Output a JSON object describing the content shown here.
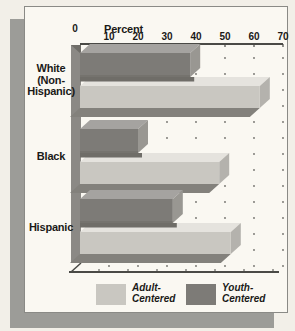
{
  "chart_data": {
    "type": "bar",
    "orientation": "horizontal",
    "xlabel": "Percent",
    "categories": [
      "White (Non-Hispanic)",
      "Black",
      "Hispanic"
    ],
    "category_label_lines": [
      [
        "White",
        "(Non-",
        "Hispanic)"
      ],
      [
        "Black"
      ],
      [
        "Hispanic"
      ]
    ],
    "series": [
      {
        "name": "Adult-Centered",
        "values": [
          62,
          48,
          52
        ]
      },
      {
        "name": "Youth-Centered",
        "values": [
          38,
          20,
          32
        ]
      }
    ],
    "xlim": [
      0,
      70
    ],
    "tick_step": 10,
    "tick_labels": [
      "0",
      "10",
      "20",
      "30",
      "40",
      "50",
      "60",
      "70"
    ],
    "grid": "dotted-vertical",
    "legend_position": "bottom",
    "style": "3d-extruded-bars"
  },
  "legend": {
    "items": [
      {
        "lines": [
          "Adult-",
          "Centered"
        ],
        "series": "Adult-Centered"
      },
      {
        "lines": [
          "Youth-",
          "Centered"
        ],
        "series": "Youth-Centered"
      }
    ]
  },
  "colors": {
    "page_bg": "#f2efe8",
    "card_bg": "#faf8f2",
    "card_border": "#8a8a86",
    "card_shadow": "#9c9c98",
    "adult_front": "#c9c7c1",
    "adult_top": "#e5e3de",
    "adult_side": "#b4b2ad",
    "youth_front": "#7d7b77",
    "youth_top": "#a5a3a0",
    "youth_side": "#999792",
    "youth_cast_shadow": "#6f6d68",
    "bar_under_shadow": "#83817c",
    "axis_wall": "#8b8985",
    "axis_line": "#4a4a46",
    "grid_dot": "#6f6f6a",
    "text": "#1a1a18"
  }
}
